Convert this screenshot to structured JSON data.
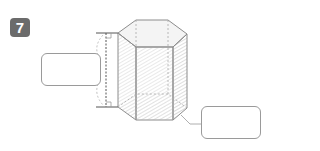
{
  "problem": {
    "number": "7",
    "figure": "hexagonal-prism",
    "label_boxes": [
      {
        "id": "height",
        "value": ""
      },
      {
        "id": "base",
        "value": ""
      }
    ]
  },
  "colors": {
    "badge": "#6b6b6b",
    "edge": "#8c8c8c",
    "face_light": "#efefef",
    "face_dark": "#d9d9d9",
    "box_border": "#9a9a9a"
  }
}
